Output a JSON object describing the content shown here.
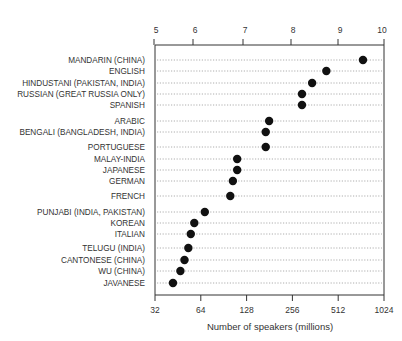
{
  "chart_data": {
    "type": "scatter",
    "subtype": "dot-plot",
    "title": "",
    "xlabel": "Number of speakers (millions)",
    "ylabel": "",
    "x_scale": "log2",
    "xlim": [
      32,
      1024
    ],
    "bottom_axis_ticks": [
      "32",
      "64",
      "128",
      "256",
      "512",
      "1024"
    ],
    "top_axis_ticks": [
      "5",
      "6",
      "7",
      "8",
      "9",
      "10"
    ],
    "grid": "dotted horizontal guide lines per row",
    "legend": "none",
    "categories": [
      "MANDARIN (CHINA)",
      "ENGLISH",
      "HINDUSTANI (PAKISTAN, INDIA)",
      "RUSSIAN (GREAT RUSSIA ONLY)",
      "SPANISH",
      "ARABIC",
      "BENGALI (BANGLADESH, INDIA)",
      "PORTUGUESE",
      "MALAY-INDIA",
      "JAPANESE",
      "GERMAN",
      "FRENCH",
      "PUNJABI (INDIA, PAKISTAN)",
      "KOREAN",
      "ITALIAN",
      "TELUGU (INDIA)",
      "CANTONESE (CHINA)",
      "WU (CHINA)",
      "JAVANESE"
    ],
    "values": [
      745,
      428,
      345,
      296,
      296,
      180,
      171,
      171,
      111,
      111,
      104,
      100,
      68,
      58,
      55,
      53,
      50,
      47,
      42
    ],
    "row_y": [
      60,
      71,
      83,
      94,
      105,
      121,
      132,
      147,
      159,
      170,
      181,
      196,
      212,
      223,
      234,
      248,
      260,
      271,
      283
    ]
  }
}
